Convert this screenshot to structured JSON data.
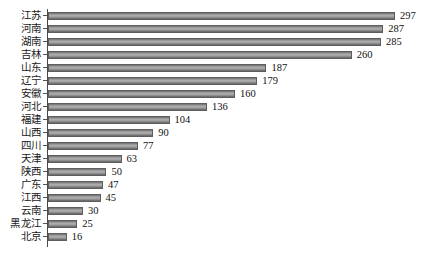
{
  "chart_data": {
    "type": "bar",
    "orientation": "horizontal",
    "title": "",
    "subtitle": "",
    "xlabel": "",
    "ylabel": "",
    "grid": false,
    "legend": null,
    "legend_position": "none",
    "xlim": [
      0,
      297
    ],
    "axis_line": "left-vertical",
    "data_labels": true,
    "bar_color": "#9a9a9a",
    "bar_edge_color": "#5d5d5d",
    "background": "#ffffff",
    "text_color": "#1a1a1a",
    "categories": [
      "江苏",
      "河南",
      "湖南",
      "吉林",
      "山东",
      "辽宁",
      "安徽",
      "河北",
      "福建",
      "山西",
      "四川",
      "天津",
      "陕西",
      "广东",
      "江西",
      "云南",
      "黑龙江",
      "北京"
    ],
    "values": [
      297,
      287,
      285,
      260,
      187,
      179,
      160,
      136,
      104,
      90,
      77,
      63,
      50,
      47,
      45,
      30,
      25,
      16
    ],
    "points": [
      {
        "category": "江苏",
        "value": 297
      },
      {
        "category": "河南",
        "value": 287
      },
      {
        "category": "湖南",
        "value": 285
      },
      {
        "category": "吉林",
        "value": 260
      },
      {
        "category": "山东",
        "value": 187
      },
      {
        "category": "辽宁",
        "value": 179
      },
      {
        "category": "安徽",
        "value": 160
      },
      {
        "category": "河北",
        "value": 136
      },
      {
        "category": "福建",
        "value": 104
      },
      {
        "category": "山西",
        "value": 90
      },
      {
        "category": "四川",
        "value": 77
      },
      {
        "category": "天津",
        "value": 63
      },
      {
        "category": "陕西",
        "value": 50
      },
      {
        "category": "广东",
        "value": 47
      },
      {
        "category": "江西",
        "value": 45
      },
      {
        "category": "云南",
        "value": 30
      },
      {
        "category": "黑龙江",
        "value": 25
      },
      {
        "category": "北京",
        "value": 16
      }
    ]
  }
}
